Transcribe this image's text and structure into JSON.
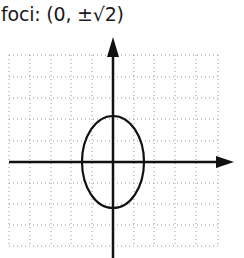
{
  "caption": {
    "label": "foci:",
    "value": "(0, ±√2)"
  },
  "diagram": {
    "type": "ellipse-on-grid",
    "grid": {
      "style": "dotted",
      "color": "#9a9a9a",
      "x_lines": [
        9,
        30,
        51,
        71,
        92,
        134,
        154,
        175,
        196,
        218
      ],
      "y_lines": [
        55,
        77,
        98,
        119,
        141,
        183,
        204,
        225,
        246
      ],
      "x_min": 9,
      "x_max": 218,
      "y_min": 55,
      "y_max": 246
    },
    "axes": {
      "color": "#111111",
      "origin": {
        "x": 113,
        "y": 162
      },
      "x_axis": {
        "from": 9,
        "to": 234
      },
      "y_axis": {
        "from": 258,
        "to": 37
      }
    },
    "ellipse": {
      "cx": 113,
      "cy": 162,
      "rx": 31,
      "ry": 46,
      "stroke": "#111111"
    }
  }
}
